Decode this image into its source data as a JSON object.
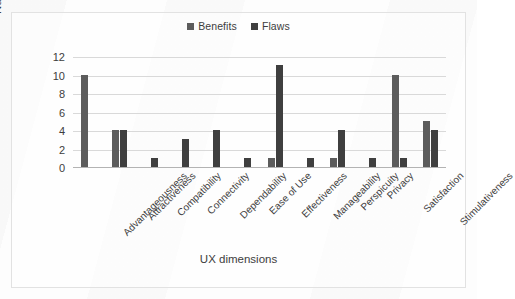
{
  "chart_data": {
    "type": "bar",
    "title": "",
    "xlabel": "UX dimensions",
    "ylabel": "Number of comments",
    "ylim": [
      0,
      12
    ],
    "yticks": [
      0,
      2,
      4,
      6,
      8,
      10,
      12
    ],
    "grid": true,
    "legend_position": "top-center",
    "categories": [
      "Advantageousness",
      "Attractiveness",
      "Compatibility",
      "Connectivity",
      "Dependability",
      "Ease of Use",
      "Effectiveness",
      "Manageability",
      "Perspicuity",
      "Privacy",
      "Satisfaction",
      "Stimulativeness"
    ],
    "series": [
      {
        "name": "Benefits",
        "color": "#5c5c5c",
        "values": [
          10,
          4,
          0,
          0,
          0,
          0,
          1,
          0,
          1,
          0,
          10,
          5
        ]
      },
      {
        "name": "Flaws",
        "color": "#3f3f3f",
        "values": [
          0,
          4,
          1,
          3,
          4,
          1,
          11,
          1,
          4,
          1,
          1,
          4
        ]
      }
    ]
  },
  "legend": {
    "items": [
      {
        "label": "Benefits",
        "color": "#5c5c5c"
      },
      {
        "label": "Flaws",
        "color": "#3f3f3f"
      }
    ]
  },
  "axes": {
    "y_title": "Number of comments",
    "x_title": "UX dimensions",
    "y_tick_labels": [
      "12",
      "10",
      "8",
      "6",
      "4",
      "2",
      "0"
    ]
  }
}
